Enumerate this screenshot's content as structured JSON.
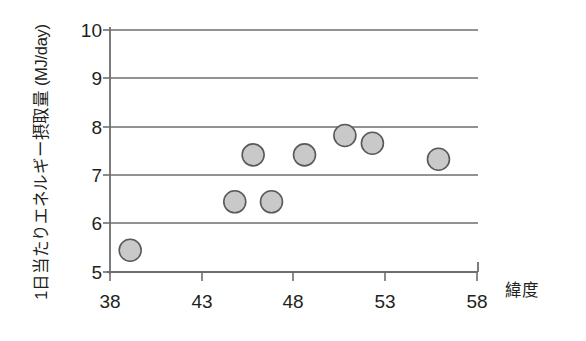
{
  "chart_data": {
    "type": "scatter",
    "title": "",
    "xlabel": "緯度",
    "ylabel": "1日当たりエネルギー摂取量 (MJ/day)",
    "xlim": [
      38,
      58
    ],
    "ylim": [
      5,
      10
    ],
    "xticks": [
      "38",
      "43",
      "48",
      "53",
      "58"
    ],
    "xtick_values": [
      38,
      43,
      48,
      53,
      58
    ],
    "yticks": [
      "5",
      "6",
      "7",
      "8",
      "9",
      "10"
    ],
    "ytick_values": [
      5,
      6,
      7,
      8,
      9,
      10
    ],
    "grid": "horizontal",
    "legend": "none",
    "marker": {
      "shape": "circle",
      "fill_color": "#c9c9c9",
      "edge_color": "#58595b",
      "diameter_px": 22
    },
    "series": [
      {
        "name": "エネルギー摂取量",
        "points": [
          {
            "x": 39.1,
            "y": 5.45
          },
          {
            "x": 44.8,
            "y": 6.45
          },
          {
            "x": 46.8,
            "y": 6.45
          },
          {
            "x": 45.8,
            "y": 7.42
          },
          {
            "x": 48.6,
            "y": 7.42
          },
          {
            "x": 50.8,
            "y": 7.82
          },
          {
            "x": 52.3,
            "y": 7.66
          },
          {
            "x": 55.9,
            "y": 7.33
          }
        ]
      }
    ]
  },
  "axes": {
    "y_axis_title": "1日当たりエネルギー摂取量 (MJ/day)",
    "x_axis_title": "緯度"
  }
}
